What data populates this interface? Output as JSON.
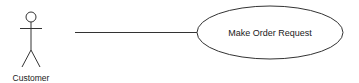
{
  "diagram": {
    "type": "use-case",
    "actor": {
      "name": "Customer",
      "icon": "stick-figure-icon"
    },
    "use_case": {
      "label": "Make Order Request",
      "shape": "ellipse"
    },
    "association": {
      "from": "Customer",
      "to": "Make Order Request"
    },
    "colors": {
      "stroke": "#333333",
      "background": "#ffffff",
      "text": "#1a1a1a"
    }
  }
}
